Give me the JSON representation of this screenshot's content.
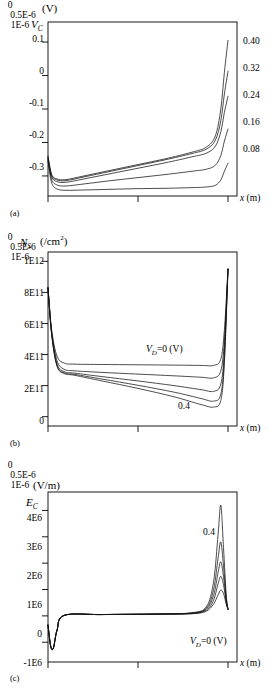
{
  "figure": {
    "type": "multi-panel-line-plot",
    "panels": [
      "a",
      "b",
      "c"
    ]
  },
  "panel_a": {
    "tag": "(a)",
    "y_unit": "(V)",
    "y_var": "V",
    "y_var_sub": "C",
    "x_title": "x (m)",
    "y_ticks": [
      "0.1",
      "0",
      "-0.1",
      "-0.2",
      "-0.3"
    ],
    "x_ticks": [
      "0",
      "0.5E-6",
      "1E-6"
    ],
    "curve_tags": [
      "0.40",
      "0.32",
      "0.24",
      "0.16",
      "0.08"
    ]
  },
  "panel_b": {
    "tag": "(b)",
    "y_unit": "(/cm",
    "y_unit_sup": "2",
    "y_unit_close": ")",
    "y_var": "N",
    "y_var_sub": "S",
    "x_title": "x (m)",
    "y_ticks": [
      "1E12",
      "8E11",
      "6E11",
      "4E11",
      "2E11",
      "0"
    ],
    "x_ticks": [
      "0",
      "0.5E-6",
      "1E-6"
    ],
    "annotation_top": "V_D=0 (V)",
    "annotation_top_var": "V",
    "annotation_top_sub": "D",
    "annotation_top_rest": "=0 (V)",
    "annotation_bottom": "0.4"
  },
  "panel_c": {
    "tag": "(c)",
    "y_unit": "(V/m)",
    "y_var": "E",
    "y_var_sub": "C",
    "x_title": "x (m)",
    "y_ticks": [
      "4E6",
      "3E6",
      "2E6",
      "1E6",
      "0",
      "-1E6"
    ],
    "x_ticks": [
      "0",
      "0.5E-6",
      "1E-6"
    ],
    "annotation_top": "0.4",
    "annotation_bottom_var": "V",
    "annotation_bottom_sub": "D",
    "annotation_bottom_rest": "=0 (V)"
  },
  "chart_data": [
    {
      "type": "line",
      "panel": "a",
      "title": "",
      "xlabel": "x (m)",
      "ylabel": "V_C (V)",
      "xlim": [
        0,
        1.05e-06
      ],
      "ylim": [
        -0.36,
        0.16
      ],
      "xticks": [
        0,
        5e-07,
        1e-06
      ],
      "xticklabels": [
        "0",
        "0.5E-6",
        "1E-6"
      ],
      "yticks": [
        0.1,
        0,
        -0.1,
        -0.2,
        -0.3
      ],
      "yticklabels": [
        "0.1",
        "0",
        "-0.1",
        "-0.2",
        "-0.3"
      ],
      "grid": false,
      "legend": "curve end labels at right, V_D values in volts",
      "series": [
        {
          "name": "0.40",
          "x": [
            0,
            2e-08,
            5e-08,
            1e-07,
            2e-07,
            3.5e-07,
            5e-07,
            6.5e-07,
            8e-07,
            8.8e-07,
            9.3e-07,
            9.6e-07,
            9.8e-07,
            1e-06
          ],
          "y": [
            -0.241,
            -0.295,
            -0.309,
            -0.311,
            -0.3,
            -0.283,
            -0.266,
            -0.249,
            -0.229,
            -0.214,
            -0.18,
            -0.1,
            0.01,
            0.105
          ]
        },
        {
          "name": "0.32",
          "x": [
            0,
            2e-08,
            5e-08,
            1e-07,
            2e-07,
            3.5e-07,
            5e-07,
            6.5e-07,
            8e-07,
            8.8e-07,
            9.3e-07,
            9.6e-07,
            9.8e-07,
            1e-06
          ],
          "y": [
            -0.244,
            -0.298,
            -0.312,
            -0.314,
            -0.303,
            -0.286,
            -0.269,
            -0.252,
            -0.233,
            -0.22,
            -0.193,
            -0.135,
            -0.055,
            0.013
          ]
        },
        {
          "name": "0.24",
          "x": [
            0,
            2e-08,
            5e-08,
            1e-07,
            2e-07,
            3.5e-07,
            5e-07,
            6.5e-07,
            8e-07,
            8.8e-07,
            9.3e-07,
            9.6e-07,
            9.8e-07,
            1e-06
          ],
          "y": [
            -0.247,
            -0.302,
            -0.317,
            -0.319,
            -0.309,
            -0.293,
            -0.277,
            -0.261,
            -0.243,
            -0.232,
            -0.211,
            -0.168,
            -0.11,
            -0.062
          ]
        },
        {
          "name": "0.16",
          "x": [
            0,
            2e-08,
            5e-08,
            1e-07,
            2e-07,
            3.5e-07,
            5e-07,
            6.5e-07,
            8e-07,
            8.8e-07,
            9.3e-07,
            9.6e-07,
            9.8e-07,
            1e-06
          ],
          "y": [
            -0.252,
            -0.31,
            -0.327,
            -0.33,
            -0.324,
            -0.314,
            -0.305,
            -0.296,
            -0.286,
            -0.28,
            -0.268,
            -0.239,
            -0.196,
            -0.16
          ]
        },
        {
          "name": "0.08",
          "x": [
            0,
            2e-08,
            5e-08,
            1e-07,
            2e-07,
            3.5e-07,
            5e-07,
            6.5e-07,
            8e-07,
            8.8e-07,
            9.3e-07,
            9.6e-07,
            9.8e-07,
            1e-06
          ],
          "y": [
            -0.256,
            -0.32,
            -0.339,
            -0.343,
            -0.342,
            -0.34,
            -0.338,
            -0.337,
            -0.335,
            -0.333,
            -0.328,
            -0.312,
            -0.286,
            -0.262
          ]
        }
      ]
    },
    {
      "type": "line",
      "panel": "b",
      "title": "",
      "xlabel": "x (m)",
      "ylabel": "N_S (/cm^2)",
      "xlim": [
        0,
        1.05e-06
      ],
      "ylim": [
        -60000000000.0,
        1060000000000.0
      ],
      "xticks": [
        0,
        5e-07,
        1e-06
      ],
      "xticklabels": [
        "0",
        "0.5E-6",
        "1E-6"
      ],
      "yticks": [
        1000000000000.0,
        800000000000.0,
        600000000000.0,
        400000000000.0,
        200000000000.0,
        0
      ],
      "yticklabels": [
        "1E12",
        "8E11",
        "6E11",
        "4E11",
        "2E11",
        "0"
      ],
      "grid": false,
      "annotations": [
        "V_D=0 (V)",
        "0.4"
      ],
      "series": [
        {
          "name": "V_D=0",
          "x": [
            0,
            2e-08,
            5e-08,
            9e-08,
            1.5e-07,
            3e-07,
            5e-07,
            7e-07,
            8.5e-07,
            9.2e-07,
            9.6e-07,
            9.8e-07,
            1e-06
          ],
          "y": [
            830000000000.0,
            560000000000.0,
            390000000000.0,
            345000000000.0,
            338000000000.0,
            336000000000.0,
            334000000000.0,
            332000000000.0,
            330000000000.0,
            330000000000.0,
            370000000000.0,
            560000000000.0,
            950000000000.0
          ]
        },
        {
          "name": "0.1",
          "x": [
            0,
            2e-08,
            5e-08,
            9e-08,
            1.5e-07,
            3e-07,
            5e-07,
            7e-07,
            8.5e-07,
            9.2e-07,
            9.6e-07,
            9.8e-07,
            1e-06
          ],
          "y": [
            830000000000.0,
            550000000000.0,
            360000000000.0,
            305000000000.0,
            295000000000.0,
            285000000000.0,
            274000000000.0,
            263000000000.0,
            254000000000.0,
            250000000000.0,
            295000000000.0,
            490000000000.0,
            950000000000.0
          ]
        },
        {
          "name": "0.2",
          "x": [
            0,
            2e-08,
            5e-08,
            9e-08,
            1.5e-07,
            3e-07,
            5e-07,
            7e-07,
            8.5e-07,
            9.2e-07,
            9.6e-07,
            9.8e-07,
            1e-06
          ],
          "y": [
            830000000000.0,
            540000000000.0,
            340000000000.0,
            290000000000.0,
            280000000000.0,
            258000000000.0,
            230000000000.0,
            200000000000.0,
            174000000000.0,
            163000000000.0,
            210000000000.0,
            430000000000.0,
            950000000000.0
          ]
        },
        {
          "name": "0.3",
          "x": [
            0,
            2e-08,
            5e-08,
            9e-08,
            1.5e-07,
            3e-07,
            5e-07,
            7e-07,
            8.5e-07,
            9.2e-07,
            9.6e-07,
            9.8e-07,
            1e-06
          ],
          "y": [
            830000000000.0,
            535000000000.0,
            330000000000.0,
            282000000000.0,
            272000000000.0,
            242000000000.0,
            202000000000.0,
            158000000000.0,
            117000000000.0,
            100000000000.0,
            145000000000.0,
            380000000000.0,
            950000000000.0
          ]
        },
        {
          "name": "0.4",
          "x": [
            0,
            2e-08,
            5e-08,
            9e-08,
            1.5e-07,
            3e-07,
            5e-07,
            7e-07,
            8.5e-07,
            9.2e-07,
            9.6e-07,
            9.8e-07,
            1e-06
          ],
          "y": [
            830000000000.0,
            530000000000.0,
            325000000000.0,
            278000000000.0,
            266000000000.0,
            230000000000.0,
            182000000000.0,
            128000000000.0,
            78000000000.0,
            62000000000.0,
            105000000000.0,
            350000000000.0,
            950000000000.0
          ]
        }
      ]
    },
    {
      "type": "line",
      "panel": "c",
      "title": "",
      "xlabel": "x (m)",
      "ylabel": "E_C (V/m)",
      "xlim": [
        0,
        1.05e-06
      ],
      "ylim": [
        -1750000.0,
        4700000.0
      ],
      "xticks": [
        0,
        5e-07,
        1e-06
      ],
      "xticklabels": [
        "0",
        "0.5E-6",
        "1E-6"
      ],
      "yticks": [
        4000000.0,
        3000000.0,
        2000000.0,
        1000000.0,
        0,
        -1000000.0
      ],
      "yticklabels": [
        "4E6",
        "3E6",
        "2E6",
        "1E6",
        "0",
        "-1E6"
      ],
      "grid": false,
      "annotations": [
        "0.4",
        "V_D=0 (V)"
      ],
      "series": [
        {
          "name": "0.4",
          "x": [
            0,
            1.5e-08,
            3e-08,
            5e-08,
            9e-08,
            3e-07,
            6e-07,
            8e-07,
            8.8e-07,
            9.2e-07,
            9.45e-07,
            9.6e-07,
            9.75e-07,
            9.9e-07,
            1e-06
          ],
          "y": [
            -350000.0,
            -1150000.0,
            -1220000.0,
            -550000.0,
            20000.0,
            50000.0,
            70000.0,
            120000.0,
            350000.0,
            1300000.0,
            3100000.0,
            4200000.0,
            2600000.0,
            800000.0,
            250000.0
          ]
        },
        {
          "name": "0.3",
          "x": [
            0,
            1.5e-08,
            3e-08,
            5e-08,
            9e-08,
            3e-07,
            6e-07,
            8e-07,
            8.8e-07,
            9.2e-07,
            9.45e-07,
            9.6e-07,
            9.75e-07,
            9.9e-07,
            1e-06
          ],
          "y": [
            -350000.0,
            -1150000.0,
            -1220000.0,
            -550000.0,
            20000.0,
            50000.0,
            70000.0,
            110000.0,
            300000.0,
            1000000.0,
            2200000.0,
            2800000.0,
            1900000.0,
            700000.0,
            250000.0
          ]
        },
        {
          "name": "0.2",
          "x": [
            0,
            1.5e-08,
            3e-08,
            5e-08,
            9e-08,
            3e-07,
            6e-07,
            8e-07,
            8.8e-07,
            9.2e-07,
            9.45e-07,
            9.6e-07,
            9.75e-07,
            9.9e-07,
            1e-06
          ],
          "y": [
            -350000.0,
            -1150000.0,
            -1220000.0,
            -550000.0,
            20000.0,
            50000.0,
            70000.0,
            100000.0,
            260000.0,
            780000.0,
            1650000.0,
            2050000.0,
            1500000.0,
            600000.0,
            250000.0
          ]
        },
        {
          "name": "0.1",
          "x": [
            0,
            1.5e-08,
            3e-08,
            5e-08,
            9e-08,
            3e-07,
            6e-07,
            8e-07,
            8.8e-07,
            9.2e-07,
            9.45e-07,
            9.6e-07,
            9.75e-07,
            9.9e-07,
            1e-06
          ],
          "y": [
            -350000.0,
            -1150000.0,
            -1220000.0,
            -550000.0,
            20000.0,
            50000.0,
            70000.0,
            90000.0,
            220000.0,
            600000.0,
            1220000.0,
            1500000.0,
            1180000.0,
            520000.0,
            250000.0
          ]
        },
        {
          "name": "V_D=0",
          "x": [
            0,
            1.5e-08,
            3e-08,
            5e-08,
            9e-08,
            3e-07,
            6e-07,
            8e-07,
            8.8e-07,
            9.2e-07,
            9.45e-07,
            9.6e-07,
            9.75e-07,
            9.9e-07,
            1e-06
          ],
          "y": [
            -350000.0,
            -1150000.0,
            -1220000.0,
            -550000.0,
            20000.0,
            50000.0,
            60000.0,
            80000.0,
            180000.0,
            450000.0,
            800000.0,
            980000.0,
            850000.0,
            450000.0,
            250000.0
          ]
        }
      ]
    }
  ]
}
